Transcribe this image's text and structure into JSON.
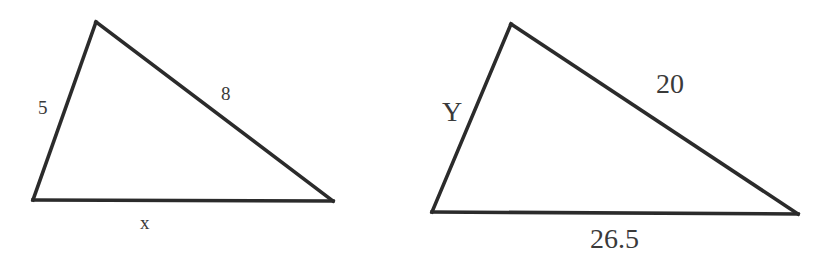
{
  "diagram": {
    "type": "similar-triangles",
    "stroke_color": "#2b2b2b",
    "label_color": "#3a3a3a",
    "triangles": [
      {
        "id": "triangle-small",
        "vertices": {
          "apex": [
            96,
            22
          ],
          "bottom_left": [
            33,
            200
          ],
          "bottom_right": [
            333,
            201
          ]
        },
        "sides": {
          "left": "5",
          "hypotenuse": "8",
          "base": "x"
        }
      },
      {
        "id": "triangle-large",
        "vertices": {
          "apex": [
            511,
            24
          ],
          "bottom_left": [
            432,
            212
          ],
          "bottom_right": [
            798,
            214
          ]
        },
        "sides": {
          "left": "Y",
          "hypotenuse": "20",
          "base": "26.5"
        }
      }
    ]
  }
}
